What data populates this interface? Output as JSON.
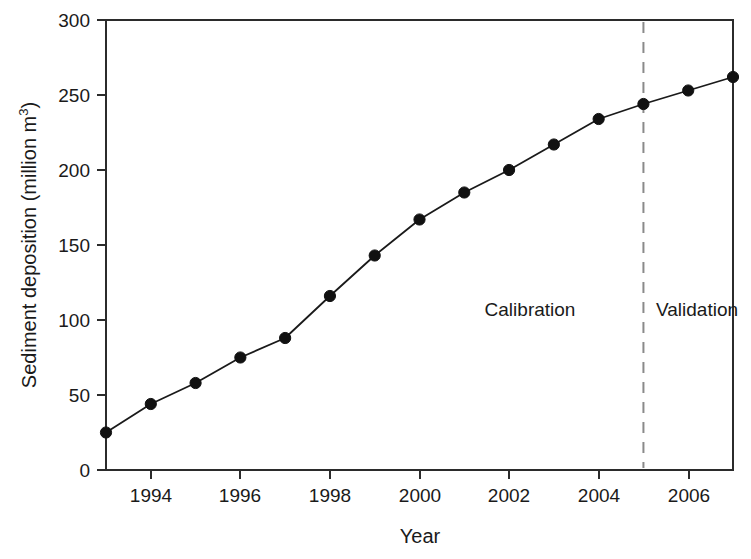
{
  "chart_data": {
    "type": "line",
    "title": "",
    "xlabel": "Year",
    "ylabel": "Sediment deposition (million m",
    "ylabel_sup": "3",
    "ylabel_tail": ")",
    "xlim": [
      1993,
      2007
    ],
    "ylim": [
      0,
      300
    ],
    "grid": false,
    "legend": "none",
    "x": [
      1993,
      1994,
      1995,
      1996,
      1997,
      1998,
      1999,
      2000,
      2001,
      2002,
      2003,
      2004,
      2005,
      2006,
      2007
    ],
    "values": [
      25,
      44,
      58,
      75,
      88,
      116,
      143,
      167,
      185,
      200,
      217,
      234,
      244,
      253,
      262
    ],
    "series": [
      {
        "name": "Sediment deposition",
        "values": [
          25,
          44,
          58,
          75,
          88,
          116,
          143,
          167,
          185,
          200,
          217,
          234,
          244,
          253,
          262
        ]
      }
    ],
    "x_ticks": [
      1994,
      1996,
      1998,
      2000,
      2002,
      2004,
      2006
    ],
    "x_tick_labels": [
      "1994",
      "1996",
      "1998",
      "2000",
      "2002",
      "2004",
      "2006"
    ],
    "y_ticks": [
      0,
      50,
      100,
      150,
      200,
      250,
      300
    ],
    "y_tick_labels": [
      "0",
      "50",
      "100",
      "150",
      "200",
      "250",
      "300"
    ],
    "annotations": [
      {
        "text": "Calibration",
        "x": 2001.3,
        "y": 104,
        "role": "period-label"
      },
      {
        "text": "Validation",
        "x": 2005.2,
        "y": 104,
        "role": "period-label"
      }
    ],
    "divider": {
      "x": 2005,
      "style": "dashed",
      "label": "calibration-validation-split",
      "color": "#8a8a8a"
    },
    "colors": {
      "line": "#1a1a1a",
      "marker": "#111111",
      "axis": "#2b2b2b",
      "divider": "#8a8a8a",
      "background": "#ffffff"
    }
  },
  "axis": {
    "x_title": "Year",
    "y_title_main": "Sediment deposition (million m",
    "y_title_sup": "3",
    "y_title_close": ")"
  },
  "labels": {
    "calibration": "Calibration",
    "validation": "Validation"
  },
  "ticks": {
    "y": [
      "300",
      "250",
      "200",
      "150",
      "100",
      "50",
      "0"
    ],
    "x": [
      "1994",
      "1996",
      "1998",
      "2000",
      "2002",
      "2004",
      "2006"
    ]
  }
}
